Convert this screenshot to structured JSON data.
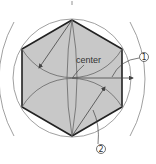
{
  "diagram": {
    "labels": {
      "center": "center",
      "marker_1": "1",
      "marker_2": "2"
    },
    "colors": {
      "fill": "#c8c8c8",
      "hex_stroke": "#222222",
      "construction": "#777777",
      "background": "#ffffff"
    },
    "geometry": {
      "center": [
        72,
        78
      ],
      "radius": 58,
      "vertices": [
        [
          72,
          20
        ],
        [
          122,
          49
        ],
        [
          122,
          107
        ],
        [
          72,
          136
        ],
        [
          22,
          107
        ],
        [
          22,
          49
        ]
      ]
    }
  }
}
